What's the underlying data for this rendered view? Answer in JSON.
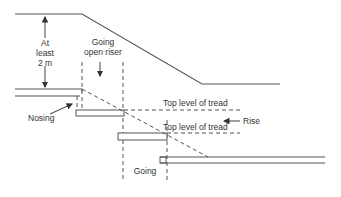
{
  "diagram": {
    "type": "stair-section",
    "labels": {
      "headroom_line1": "At",
      "headroom_line2": "least",
      "headroom_line3": "2 m",
      "going_open_riser_line1": "Going",
      "going_open_riser_line2": "open riser",
      "nosing": "Nosing",
      "top_level_tread_1": "Top level of tread",
      "top_level_tread_2": "Top level of tread",
      "rise": "Rise",
      "going": "Going"
    },
    "colors": {
      "stroke": "#555555",
      "text": "#333333",
      "background": "#ffffff"
    }
  }
}
